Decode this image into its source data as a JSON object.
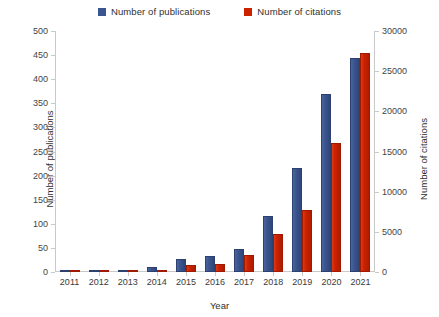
{
  "chart_data": {
    "type": "bar",
    "title": "",
    "xlabel": "Year",
    "ylabel": "Number of publications",
    "y2label": "Number of citations",
    "categories": [
      "2011",
      "2012",
      "2013",
      "2014",
      "2015",
      "2016",
      "2017",
      "2018",
      "2019",
      "2020",
      "2021"
    ],
    "series": [
      {
        "name": "Number of publications",
        "color": "#3b5591",
        "axis": "left",
        "values": [
          3,
          2,
          5,
          11,
          28,
          33,
          47,
          117,
          215,
          370,
          444
        ]
      },
      {
        "name": "Number of citations",
        "color": "#cc2200",
        "axis": "right",
        "values": [
          30,
          50,
          150,
          300,
          900,
          1000,
          2100,
          4700,
          7700,
          16000,
          27300
        ]
      }
    ],
    "ylim": [
      0,
      500
    ],
    "y2lim": [
      0,
      30000
    ],
    "yticks": [
      0,
      50,
      100,
      150,
      200,
      250,
      300,
      350,
      400,
      450,
      500
    ],
    "y2ticks": [
      0,
      5000,
      10000,
      15000,
      20000,
      25000,
      30000
    ],
    "grid": false,
    "legend_position": "top-center"
  },
  "legend": {
    "entries": [
      {
        "label": "Number of publications",
        "swatch_icon": "square-swatch-blue"
      },
      {
        "label": "Number of citations",
        "swatch_icon": "square-swatch-red"
      }
    ]
  },
  "axes": {
    "left": {
      "title": "Number of publications",
      "tick_labels": [
        "0",
        "50",
        "100",
        "150",
        "200",
        "250",
        "300",
        "350",
        "400",
        "450",
        "500"
      ]
    },
    "right": {
      "title": "Number of citations",
      "tick_labels": [
        "0",
        "5000",
        "10000",
        "15000",
        "20000",
        "25000",
        "30000"
      ]
    },
    "x": {
      "title": "Year",
      "tick_labels": [
        "2011",
        "2012",
        "2013",
        "2014",
        "2015",
        "2016",
        "2017",
        "2018",
        "2019",
        "2020",
        "2021"
      ]
    }
  }
}
